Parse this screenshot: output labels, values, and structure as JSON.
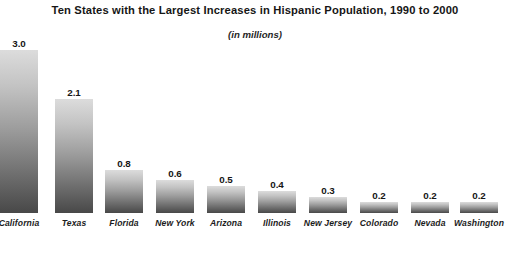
{
  "chart_data": {
    "type": "bar",
    "title": "Ten States with the Largest Increases in Hispanic Population, 1990 to 2000",
    "subtitle": "(in millions)",
    "xlabel": "",
    "ylabel": "",
    "ylim": [
      0,
      3.0
    ],
    "grid": false,
    "legend": false,
    "orientation": "vertical",
    "bar_fill": "vertical-gradient-light-to-dark-gray",
    "colors": {
      "bar_top": "#dcdcdc",
      "bar_bottom": "#484848",
      "text": "#161616",
      "background": "#ffffff"
    },
    "categories": [
      "California",
      "Texas",
      "Florida",
      "New York",
      "Arizona",
      "Illinois",
      "New Jersey",
      "Colorado",
      "Nevada",
      "Washington"
    ],
    "values": [
      3.0,
      2.1,
      0.8,
      0.6,
      0.5,
      0.4,
      0.3,
      0.2,
      0.2,
      0.2
    ],
    "data_labels": [
      "3.0",
      "2.1",
      "0.8",
      "0.6",
      "0.5",
      "0.4",
      "0.3",
      "0.2",
      "0.2",
      "0.2"
    ]
  }
}
